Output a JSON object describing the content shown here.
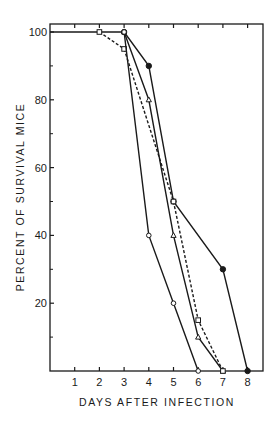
{
  "chart_data": {
    "type": "line",
    "title": "",
    "xlabel": "DAYS AFTER INFECTION",
    "ylabel": "PERCENT OF SURVIVAL MICE",
    "xlim": [
      0,
      8.2
    ],
    "ylim": [
      0,
      100
    ],
    "x_ticks": [
      1,
      2,
      3,
      4,
      5,
      6,
      7,
      8
    ],
    "y_ticks": [
      20,
      40,
      60,
      80,
      100
    ],
    "y_minor_ticks": [
      10,
      30,
      50,
      70,
      90
    ],
    "grid": false,
    "legend": null,
    "series": [
      {
        "name": "filled-circle",
        "marker": "filled-circle",
        "line": "solid",
        "x": [
          0,
          3,
          4,
          5,
          7,
          8
        ],
        "y": [
          100,
          100,
          90,
          50,
          30,
          0
        ]
      },
      {
        "name": "open-triangle",
        "marker": "open-triangle",
        "line": "solid",
        "x": [
          3,
          4,
          5,
          6,
          7
        ],
        "y": [
          100,
          80,
          40,
          10,
          0
        ]
      },
      {
        "name": "open-square",
        "marker": "open-square",
        "line": "dashed",
        "x": [
          2,
          3,
          5,
          6,
          7
        ],
        "y": [
          100,
          95,
          50,
          15,
          0
        ]
      },
      {
        "name": "open-circle",
        "marker": "open-circle",
        "line": "solid",
        "x": [
          3,
          4,
          5,
          6
        ],
        "y": [
          100,
          40,
          20,
          0
        ]
      }
    ]
  },
  "labels": {
    "xlabel": "DAYS AFTER INFECTION",
    "ylabel": "PERCENT OF SURVIVAL MICE"
  }
}
